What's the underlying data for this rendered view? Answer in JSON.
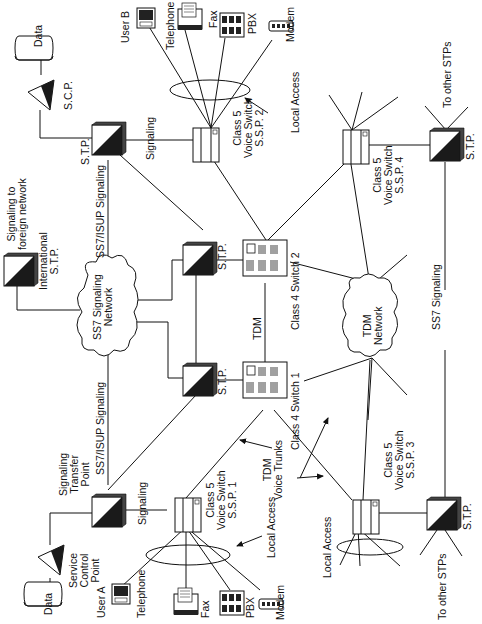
{
  "diagram": {
    "orientation": "rotated -90deg",
    "colors": {
      "line": "#111111",
      "fill_dark": "#1a1a1a",
      "fill_light": "#ffffff"
    }
  },
  "nodes": {
    "data_top": {
      "label": "Data"
    },
    "scp_top": {
      "label": "S.C.P."
    },
    "stp_top": {
      "label": "S.T.P."
    },
    "ssp2": {
      "line1": "Class 5",
      "line2": "Voice Switch",
      "line3": "S.S.P. 2"
    },
    "user_b": {
      "label": "User B"
    },
    "telephone_b": {
      "label": "Telephone"
    },
    "fax_b": {
      "label": "Fax"
    },
    "pbx_b": {
      "label": "PBX"
    },
    "modem_b": {
      "label": "Modem"
    },
    "local_access_b": {
      "label": "Local Access"
    },
    "ssp4": {
      "line1": "Class 5",
      "line2": "Voice Switch",
      "line3": "S.S.P. 4"
    },
    "stp_right_top": {
      "label": "S.T.P."
    },
    "to_other_stps_top": {
      "label": "To other STPs"
    },
    "intl_stp": {
      "line1": "International",
      "line2": "S.T.P."
    },
    "signaling_foreign": {
      "line1": "Signaling to",
      "line2": "foreign network"
    },
    "ss7_network": {
      "line1": "SS7 Signaling",
      "line2": "Network"
    },
    "stp_mid_top": {
      "label": "S.T.P."
    },
    "stp_mid_bottom": {
      "label": "S.T.P."
    },
    "class4_switch2": {
      "label": "Class 4 Switch 2"
    },
    "class4_switch1": {
      "label": "Class 4 Switch 1"
    },
    "tdm_link": {
      "label": "TDM"
    },
    "tdm_network": {
      "line1": "TDM",
      "line2": "Network"
    },
    "tdm_voice_trunks": {
      "line1": "TDM",
      "line2": "Voice Trunks"
    },
    "ss7_signaling": {
      "label": "SS7 Signaling"
    },
    "data_bottom": {
      "label": "Data"
    },
    "scp_bottom": {
      "line1": "Service",
      "line2": "Control",
      "line3": "Point"
    },
    "stp_bottom": {
      "line1": "Signaling",
      "line2": "Transfer",
      "line3": "Point"
    },
    "ssp1": {
      "line1": "Class 5",
      "line2": "Voice Switch",
      "line3": "S.S.P. 1"
    },
    "user_a": {
      "label": "User A"
    },
    "telephone_a": {
      "label": "Telephone"
    },
    "fax_a": {
      "label": "Fax"
    },
    "pbx_a": {
      "label": "PBX"
    },
    "modem_a": {
      "label": "Modem"
    },
    "local_access_a": {
      "label": "Local Access"
    },
    "local_access_c": {
      "label": "Local Access"
    },
    "ssp3": {
      "line1": "Class 5",
      "line2": "Voice Switch",
      "line3": "S.S.P. 3"
    },
    "stp_right_bottom": {
      "label": "S.T.P."
    },
    "to_other_stps_bottom": {
      "label": "To other STPs"
    }
  },
  "links": {
    "signaling_top": "Signaling",
    "signaling_bottom": "Signaling",
    "ss7_isup_top": "SS7/ISUP Signaling",
    "ss7_isup_bottom": "SS7/ISUP Signaling"
  }
}
